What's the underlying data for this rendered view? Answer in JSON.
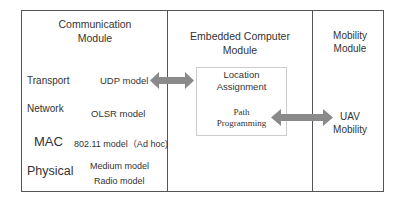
{
  "modules": {
    "communication": {
      "title_line1": "Communication",
      "title_line2": "Module",
      "layers": [
        {
          "name": "Transport",
          "model": "UDP model"
        },
        {
          "name": "Network",
          "model": "OLSR model"
        },
        {
          "name": "MAC",
          "model": "802.11 model（Ad hoc)"
        },
        {
          "name": "Physical",
          "model_line1": "Medium model",
          "model_line2": "Radio model"
        }
      ]
    },
    "embedded": {
      "title_line1": "Embedded Computer",
      "title_line2": "Module",
      "box": {
        "item1_line1": "Location",
        "item1_line2": "Assignment",
        "item2_line1": "Path",
        "item2_line2": "Programming"
      }
    },
    "mobility": {
      "title_line1": "Mobility",
      "title_line2": "Module",
      "item_line1": "UAV",
      "item_line2": "Mobility"
    }
  },
  "arrows": [
    {
      "from": "UDP model",
      "to": "Location Assignment",
      "type": "bidirectional",
      "color": "#8a8a8a"
    },
    {
      "from": "Path Programming",
      "to": "UAV Mobility",
      "type": "bidirectional",
      "color": "#8a8a8a"
    }
  ]
}
